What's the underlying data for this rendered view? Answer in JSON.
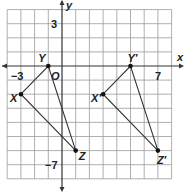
{
  "figure": {
    "type": "coordinate-plane",
    "grid": {
      "x_min": -4,
      "x_max": 8,
      "y_min": -8,
      "y_max": 4,
      "step": 1
    },
    "axes": {
      "x_label": "x",
      "y_label": "y",
      "origin_label": "O"
    },
    "tick_labels": [
      {
        "axis": "x",
        "value": -3,
        "text": "−3"
      },
      {
        "axis": "x",
        "value": 7,
        "text": "7"
      },
      {
        "axis": "y",
        "value": 3,
        "text": "3"
      },
      {
        "axis": "y",
        "value": -7,
        "text": "−7"
      }
    ],
    "triangles": [
      {
        "name": "XYZ",
        "vertices": [
          {
            "label": "X",
            "x": -3,
            "y": -2
          },
          {
            "label": "Y",
            "x": -1,
            "y": 0
          },
          {
            "label": "Z",
            "x": 1,
            "y": -6
          }
        ]
      },
      {
        "name": "X'Y'Z'",
        "vertices": [
          {
            "label": "X′",
            "x": 3,
            "y": -2
          },
          {
            "label": "Y′",
            "x": 5,
            "y": 0
          },
          {
            "label": "Z′",
            "x": 7,
            "y": -6
          }
        ]
      }
    ],
    "colors": {
      "grid": "#9a9a9a",
      "axis": "#333333",
      "line": "#333333",
      "point": "#111111"
    }
  }
}
